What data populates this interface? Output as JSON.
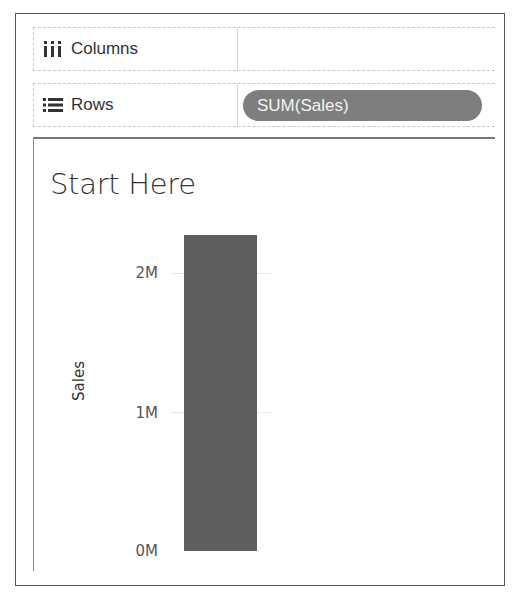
{
  "shelves": {
    "columns": {
      "label": "Columns",
      "icon": "columns-icon",
      "pills": []
    },
    "rows": {
      "label": "Rows",
      "icon": "rows-icon",
      "pills": [
        {
          "label": "SUM(Sales)"
        }
      ]
    }
  },
  "view": {
    "title": "Start Here"
  },
  "colors": {
    "bar": "#5f5f5f",
    "pill": "#7e7e7e",
    "frame": "#555555"
  },
  "chart_data": {
    "type": "bar",
    "title": "Start Here",
    "categories": [
      ""
    ],
    "values": [
      2290000
    ],
    "xlabel": "",
    "ylabel": "Sales",
    "ylim": [
      0,
      2300000
    ],
    "yticks": [
      {
        "value": 0,
        "label": "0M"
      },
      {
        "value": 1000000,
        "label": "1M"
      },
      {
        "value": 2000000,
        "label": "2M"
      }
    ],
    "grid": true,
    "legend": null
  }
}
